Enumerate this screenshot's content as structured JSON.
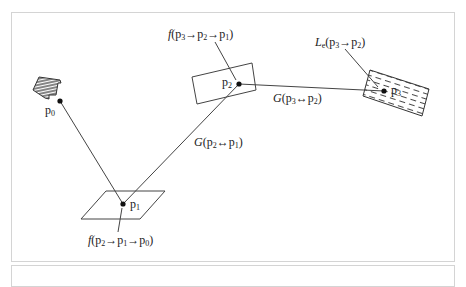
{
  "diagram": {
    "points": [
      {
        "id": "p0",
        "label": "p",
        "sub": "0",
        "x": 60,
        "y": 101
      },
      {
        "id": "p1",
        "label": "p",
        "sub": "1",
        "x": 123,
        "y": 204
      },
      {
        "id": "p2",
        "label": "p",
        "sub": "2",
        "x": 239,
        "y": 84
      },
      {
        "id": "p3",
        "label": "p",
        "sub": "3",
        "x": 384,
        "y": 91
      }
    ],
    "labels": {
      "f_p3_p2_p1": {
        "fn": "f",
        "text": "(p",
        "s1": "3",
        "a1": "→p",
        "s2": "2",
        "a2": "→p",
        "s3": "1",
        "end": ")"
      },
      "le_p3_p2": {
        "fn": "L",
        "fnsub": "e",
        "text": "(p",
        "s1": "3",
        "a1": "→p",
        "s2": "2",
        "end": ")"
      },
      "g_p3_p2": {
        "fn": "G",
        "text": "(p",
        "s1": "3",
        "a1": "↔p",
        "s2": "2",
        "end": ")"
      },
      "g_p2_p1": {
        "fn": "G",
        "text": "(p",
        "s1": "2",
        "a1": "↔p",
        "s2": "1",
        "end": ")"
      },
      "f_p2_p1_p0": {
        "fn": "f",
        "text": "(p",
        "s1": "2",
        "a1": "→p",
        "s2": "1",
        "a2": "→p",
        "s3": "0",
        "end": ")"
      }
    },
    "colors": {
      "line": "#444444",
      "frame": "#d4d4d4",
      "text": "#222222"
    }
  }
}
